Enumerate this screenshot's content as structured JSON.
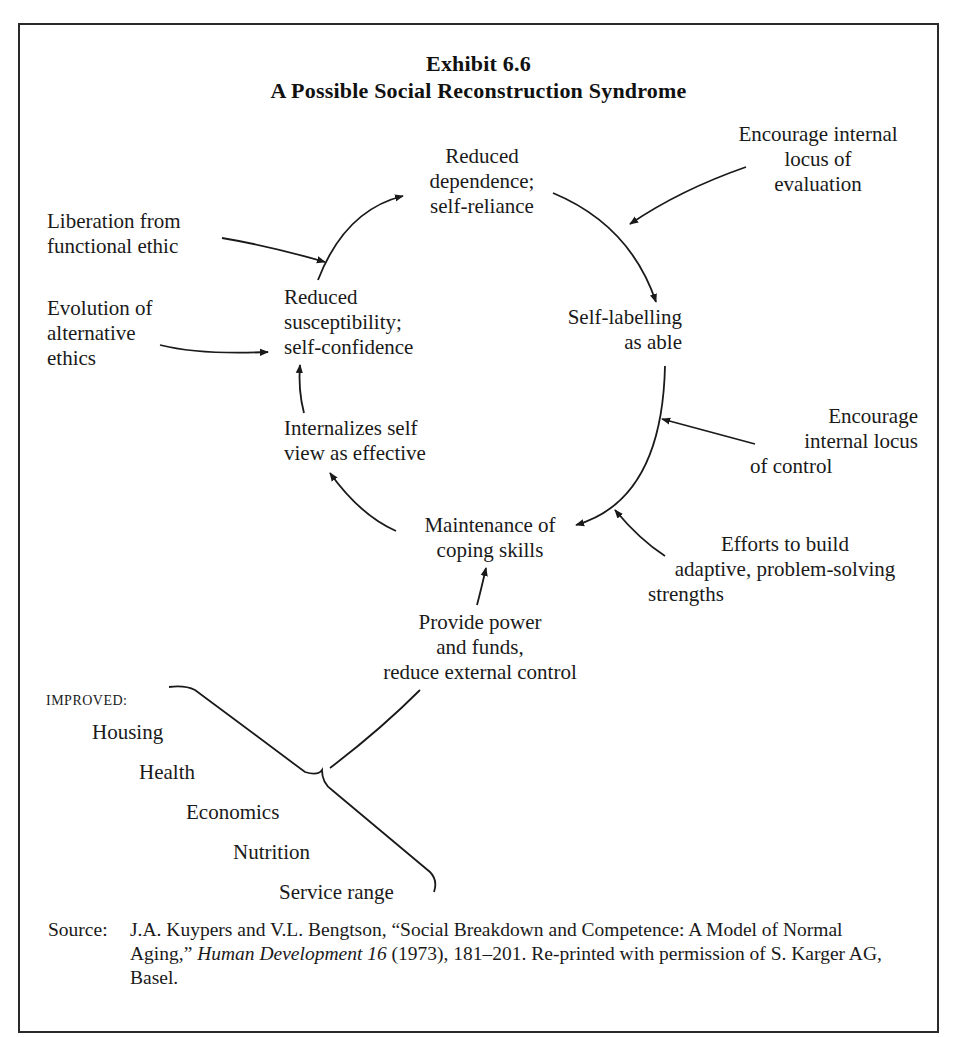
{
  "exhibit": {
    "number": "Exhibit 6.6",
    "title": "A Possible Social Reconstruction Syndrome"
  },
  "cycle_nodes": {
    "reduced_dependence": [
      "Reduced",
      "dependence;",
      "self-reliance"
    ],
    "self_labelling": [
      "Self-labelling",
      "as able"
    ],
    "maintenance": [
      "Maintenance of",
      "coping skills"
    ],
    "internalizes": [
      "Internalizes self",
      "view as effective"
    ],
    "reduced_susceptibility": [
      "Reduced",
      "susceptibility;",
      "self-confidence"
    ]
  },
  "inputs": {
    "liberation": [
      "Liberation from",
      "functional ethic"
    ],
    "evolution": [
      "Evolution of",
      "alternative",
      "ethics"
    ],
    "encourage_evaluation": [
      "Encourage internal",
      "locus of",
      "evaluation"
    ],
    "encourage_control": [
      "Encourage",
      "internal locus",
      "of control"
    ],
    "efforts": [
      "Efforts to build",
      "adaptive, problem-solving",
      "strengths"
    ],
    "provide_power": [
      "Provide power",
      "and funds,",
      "reduce external control"
    ]
  },
  "improved": {
    "heading": "IMPROVED:",
    "items": [
      "Housing",
      "Health",
      "Economics",
      "Nutrition",
      "Service range"
    ]
  },
  "source": {
    "label": "Source:",
    "authors": "J.A. Kuypers and V.L. Bengtson, “Social Breakdown and Competence: A Model of Normal Aging,” ",
    "journal": "Human Development 16",
    "rest": " (1973), 181–201. Re-printed with permission of S. Karger AG, Basel."
  },
  "colors": {
    "ink": "#1a1a1a",
    "frame": "#2a2a2a",
    "background": "#ffffff"
  }
}
